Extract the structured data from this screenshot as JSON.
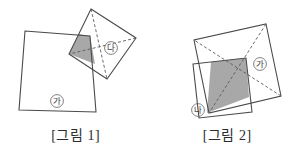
{
  "document": {
    "type": "geometry-diagram-pair",
    "description": "Two figures each showing two overlapping squares with a shaded intersection region"
  },
  "colors": {
    "stroke": "#4a4a4a",
    "shade_fill": "#a8a8a8",
    "background": "#ffffff",
    "label_text": "#3a3a3a",
    "caption_text": "#2b2b2b"
  },
  "figures": [
    {
      "id": "figure-1",
      "caption": "[그림 1]",
      "labels": [
        {
          "id": "fig1-label-ga",
          "text": "가",
          "shape": "circled",
          "x": 57,
          "y": 101
        },
        {
          "id": "fig1-label-na",
          "text": "나",
          "shape": "circled",
          "x": 111,
          "y": 48
        }
      ],
      "shapes": {
        "square_ga": {
          "name": "large-square-ga",
          "points": "25,31 90,36 96,112 19,110",
          "dashed": false
        },
        "square_na": {
          "name": "small-square-na",
          "points": "91,9 136,38 107,79 69,54",
          "dashed": false
        },
        "diagonals_na": [
          {
            "name": "diagonal-na-1",
            "points": "91,9 107,79"
          },
          {
            "name": "diagonal-na-2",
            "points": "136,38 69,54"
          }
        ],
        "shaded_overlap": {
          "name": "shaded-overlap-region",
          "points": "69,54 79,34 90,36 95,64"
        }
      }
    },
    {
      "id": "figure-2",
      "caption": "[그림 2]",
      "labels": [
        {
          "id": "fig2-label-ga",
          "text": "가",
          "shape": "circled",
          "x": 260,
          "y": 64
        },
        {
          "id": "fig2-label-na",
          "text": "나",
          "shape": "circled",
          "x": 198,
          "y": 110
        }
      ],
      "shapes": {
        "square_ga": {
          "name": "large-square-ga",
          "points": "266,24 281,96 209,113 194,40",
          "dashed": false
        },
        "diagonals_ga": [
          {
            "name": "diagonal-ga-1",
            "points": "266,24 209,113"
          },
          {
            "name": "diagonal-ga-2",
            "points": "281,96 194,40"
          }
        ],
        "square_na": {
          "name": "small-square-na",
          "points": "193,64 246,58 252,112 199,118",
          "dashed": false
        },
        "shaded_overlap": {
          "name": "shaded-overlap-region",
          "points": "211,62 246,58 249,97 207,113"
        }
      }
    }
  ]
}
